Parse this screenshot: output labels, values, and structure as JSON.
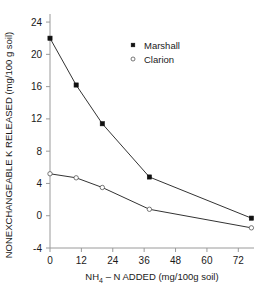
{
  "chart_data": {
    "type": "line",
    "title": "",
    "xlabel": "NH4 – N ADDED (mg/100g soil)",
    "xlabel_parts": {
      "pre": "NH",
      "sub": "4",
      "post": " – N ADDED (mg/100g soil)"
    },
    "ylabel": "NONEXCHANGEABLE K RELEASED (mg/100 g soil)",
    "xlim": [
      0,
      78
    ],
    "ylim": [
      -4,
      25
    ],
    "grid": false,
    "legend_position": "upper-center-right",
    "xticks": [
      0,
      12,
      24,
      36,
      48,
      60,
      72
    ],
    "xticklabels": [
      "0",
      "12",
      "24",
      "36",
      "48",
      "60",
      "72"
    ],
    "yticks": [
      -4,
      0,
      4,
      8,
      12,
      16,
      20,
      24
    ],
    "yticklabels": [
      "-4",
      "0",
      "4",
      "8",
      "12",
      "16",
      "20",
      "24"
    ],
    "series": [
      {
        "name": "Marshall",
        "marker": "filled-square",
        "x": [
          0,
          10,
          20,
          38,
          77
        ],
        "values": [
          22.0,
          16.2,
          11.4,
          4.8,
          -0.3
        ]
      },
      {
        "name": "Clarion",
        "marker": "open-circle",
        "x": [
          0,
          10,
          20,
          38,
          77
        ],
        "values": [
          5.2,
          4.7,
          3.5,
          0.8,
          -1.5
        ]
      }
    ],
    "legend": [
      {
        "label": "Marshall",
        "marker": "filled-square"
      },
      {
        "label": "Clarion",
        "marker": "open-circle"
      }
    ],
    "colors": {
      "axis": "#9a9a9a",
      "line": "#333333",
      "marker_filled": "#111111",
      "marker_open_edge": "#555555",
      "background": "#ffffff",
      "text": "#1a1a1a"
    }
  }
}
